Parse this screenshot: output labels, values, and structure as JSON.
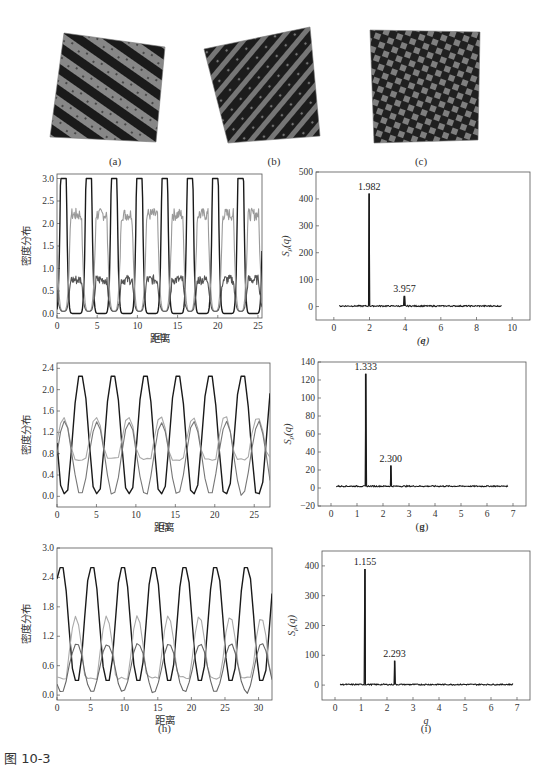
{
  "figure": {
    "caption": "图 10-3",
    "snapshots": [
      {
        "id": "a",
        "label": "(a)",
        "pattern": "stripes-lamellar"
      },
      {
        "id": "b",
        "label": "(b)",
        "pattern": "stripes-broken"
      },
      {
        "id": "c",
        "label": "(c)",
        "pattern": "checker"
      }
    ]
  },
  "chart_data": [
    {
      "id": "d",
      "panel_label": "(d)",
      "type": "line",
      "title": "",
      "xlabel": "距离",
      "ylabel": "密度分布",
      "xlim": [
        0,
        25.5
      ],
      "ylim": [
        -0.1,
        3.1
      ],
      "xticks": [
        0,
        5,
        10,
        15,
        20,
        25
      ],
      "yticks": [
        0.0,
        0.5,
        1.0,
        1.5,
        2.0,
        2.5,
        3.0
      ],
      "ytick_labels": [
        "0.0",
        "0.5",
        "1.0",
        "1.5",
        "2.0",
        "2.5",
        "3.0"
      ],
      "period": 3.15,
      "series": [
        {
          "name": "black",
          "color": "#1a1a1a",
          "peak": 3.0,
          "trough": 0.0,
          "peak_x": [
            0.8,
            3.95,
            7.1,
            10.25,
            13.4,
            16.55,
            19.7,
            22.85
          ]
        },
        {
          "name": "light-gray",
          "color": "#9a9a9a",
          "plateau": 2.2,
          "trough": 0.05
        },
        {
          "name": "dark-gray",
          "color": "#555555",
          "plateau": 0.75,
          "trough": 0.05
        }
      ]
    },
    {
      "id": "e",
      "panel_label": "(e)",
      "type": "line",
      "title": "",
      "xlabel": "q",
      "ylabel": "S_ρ(q)",
      "xlim": [
        -1,
        11
      ],
      "ylim": [
        -50,
        500
      ],
      "xticks": [
        0,
        2,
        4,
        6,
        8,
        10
      ],
      "yticks": [
        0,
        100,
        200,
        300,
        400,
        500
      ],
      "x_range_data": [
        0.3,
        9.4
      ],
      "peaks": [
        {
          "x": 1.982,
          "y": 420,
          "label": "1.982"
        },
        {
          "x": 3.957,
          "y": 38,
          "label": "3.957"
        }
      ],
      "baseline": 2
    },
    {
      "id": "f",
      "panel_label": "(f)",
      "type": "line",
      "title": "",
      "xlabel": "距离",
      "ylabel": "密度分布",
      "xlim": [
        0,
        27
      ],
      "ylim": [
        -0.2,
        2.5
      ],
      "xticks": [
        0,
        5,
        10,
        15,
        20,
        25
      ],
      "yticks": [
        0.0,
        0.4,
        0.8,
        1.2,
        1.6,
        2.0,
        2.4
      ],
      "ytick_labels": [
        "0.0",
        "0.4",
        "0.8",
        "1.2",
        "1.6",
        "2.0",
        "2.4"
      ],
      "period": 4.1,
      "series": [
        {
          "name": "black",
          "color": "#1a1a1a",
          "peak": 2.25,
          "trough": 0.05,
          "peak_x": [
            3.0,
            7.1,
            11.2,
            15.3,
            19.4,
            23.5
          ]
        },
        {
          "name": "light-gray",
          "color": "#a8a8a8",
          "peak": 1.5,
          "trough": 0.7
        },
        {
          "name": "dark-gray",
          "color": "#777777",
          "peak": 1.4,
          "trough": 0.02
        }
      ]
    },
    {
      "id": "g",
      "panel_label": "(g)",
      "type": "line",
      "title": "",
      "xlabel": "q",
      "ylabel": "S_ρ(q)",
      "xlim": [
        -0.5,
        7.5
      ],
      "ylim": [
        -20,
        140
      ],
      "xticks": [
        0,
        1,
        2,
        3,
        4,
        5,
        6,
        7
      ],
      "yticks": [
        -20,
        0,
        20,
        40,
        60,
        80,
        100,
        120,
        140
      ],
      "x_range_data": [
        0.2,
        6.8
      ],
      "peaks": [
        {
          "x": 1.333,
          "y": 127,
          "label": "1.333"
        },
        {
          "x": 2.3,
          "y": 25,
          "label": "2.300"
        }
      ],
      "baseline": 2
    },
    {
      "id": "h",
      "panel_label": "(h)",
      "type": "line",
      "title": "",
      "xlabel": "距离",
      "ylabel": "密度分布",
      "xlim": [
        0,
        32
      ],
      "ylim": [
        -0.1,
        3.0
      ],
      "xticks": [
        0,
        5,
        10,
        15,
        20,
        25,
        30
      ],
      "yticks": [
        0.0,
        0.6,
        1.2,
        1.8,
        2.4,
        3.0
      ],
      "ytick_labels": [
        "0.0",
        "0.6",
        "1.2",
        "1.8",
        "2.4",
        "3.0"
      ],
      "period": 4.6,
      "series": [
        {
          "name": "black",
          "color": "#1a1a1a",
          "peak": 2.6,
          "trough": 0.3,
          "peak_x": [
            0.6,
            5.3,
            9.8,
            14.4,
            19.1,
            23.8,
            28.3
          ]
        },
        {
          "name": "light-gray",
          "color": "#aaaaaa",
          "peak": 1.6,
          "trough": 0.35
        },
        {
          "name": "dark-gray",
          "color": "#666666",
          "peak": 1.05,
          "trough": 0.05
        }
      ]
    },
    {
      "id": "i",
      "panel_label": "(i)",
      "type": "line",
      "title": "",
      "xlabel": "q",
      "ylabel": "S_ρ(q)",
      "xlim": [
        -0.5,
        7.5
      ],
      "ylim": [
        -50,
        450
      ],
      "xticks": [
        0,
        1,
        2,
        3,
        4,
        5,
        6,
        7
      ],
      "yticks": [
        0,
        100,
        200,
        300,
        400
      ],
      "x_range_data": [
        0.2,
        6.85
      ],
      "peaks": [
        {
          "x": 1.155,
          "y": 390,
          "label": "1.155"
        },
        {
          "x": 2.293,
          "y": 82,
          "label": "2.293"
        }
      ],
      "baseline": 2
    }
  ]
}
